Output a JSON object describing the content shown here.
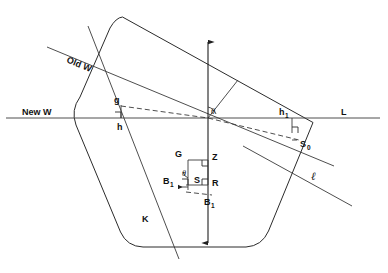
{
  "figure": {
    "type": "geometric-diagram",
    "background": "#ffffff",
    "line_color": "#2b2b2b",
    "width": 388,
    "height": 273
  },
  "labels": {
    "old_waterline": "Old W",
    "new_waterline": "New W",
    "g": "g",
    "h": "h",
    "h1_base": "h",
    "h1_sub": "1",
    "s0_base": "S",
    "s0_sub": "0",
    "L": "L",
    "script_l": "ℓ",
    "K": "K",
    "G": "G",
    "Z": "Z",
    "S": "S",
    "R": "R",
    "B1_left_base": "B",
    "B1_left_sub": "1",
    "B1_lower_base": "B",
    "B1_lower_sub": "1",
    "theta_center": "θ",
    "theta_lower": "θ"
  },
  "geometry": {
    "hull_outline": "M 122 17 L 313 122 L 260 246 L 230 263 L 128 263 L 74 204 L 74 122 Z",
    "old_waterline": {
      "x1": 47,
      "y1": 47,
      "x2": 333,
      "y2": 165
    },
    "new_waterline": {
      "x1": 6,
      "y1": 118,
      "x2": 380,
      "y2": 118
    },
    "tilt_axis": {
      "x1": 88,
      "y1": 26,
      "x2": 178,
      "y2": 258
    },
    "lower_right_line": {
      "x1": 258,
      "y1": 152,
      "x2": 352,
      "y2": 205
    },
    "vertical_axis": {
      "x": 208,
      "y_top": 36,
      "y_bottom": 248
    },
    "dashed_upper": {
      "x1": 148,
      "y1": 109,
      "x2": 208,
      "y2": 118
    },
    "dashed_lower": {
      "x1": 208,
      "y1": 118,
      "x2": 300,
      "y2": 140
    },
    "center_point": {
      "x": 208,
      "y": 118
    }
  },
  "detail_box": {
    "G": {
      "x": 188,
      "y": 160
    },
    "Z": {
      "x": 208,
      "y": 160
    },
    "S": {
      "x": 196,
      "y": 184
    },
    "R": {
      "x": 208,
      "y": 184
    },
    "B1_left": {
      "x": 175,
      "y": 184
    }
  },
  "measurements": {
    "g_marker": {
      "x": 120,
      "y": 104,
      "height": 14
    },
    "h1_marker": {
      "x": 292,
      "y": 118,
      "height": 14
    },
    "right_angle_size": 6
  }
}
